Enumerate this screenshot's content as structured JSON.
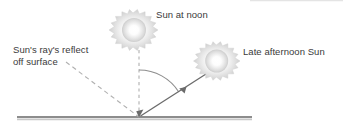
{
  "diagram": {
    "background_color": "#ffffff",
    "labels": {
      "sun_at_noon": "Sun at noon",
      "late_afternoon_sun": "Late afternoon Sun",
      "reflect_line1": "Sun's ray's reflect",
      "reflect_line2": "off surface"
    },
    "text_color": "#3a3a3a",
    "suns": [
      {
        "name": "sun-at-noon",
        "cx": 139,
        "cy": 30,
        "outer_radius": 19,
        "inner_radius": 14,
        "points": 16,
        "core_color": "#ffffff",
        "edge_color": "#c9c9c9"
      },
      {
        "name": "late-afternoon-sun",
        "cx": 222,
        "cy": 61,
        "outer_radius": 18,
        "inner_radius": 13,
        "points": 16,
        "core_color": "#ffffff",
        "edge_color": "#c9c9c9"
      }
    ],
    "ground": {
      "name": "ground-surface",
      "x1": 17,
      "x2": 252,
      "y": 117,
      "color": "#8d8d8d",
      "shadow_color": "#c8c8c8",
      "thickness": 2
    },
    "vertex": {
      "x": 139,
      "y": 117
    },
    "normal_line": {
      "name": "normal-dashed-line",
      "x1": 139,
      "y1": 50,
      "x2": 139,
      "y2": 117,
      "style": "dashed",
      "color": "#b0b0b0"
    },
    "incident_ray": {
      "name": "incident-ray",
      "x1": 206,
      "y1": 74,
      "x2": 139,
      "y2": 117,
      "style": "solid",
      "color": "#6b6b6b",
      "arrow_at": 0.55,
      "arrow_direction": "down-left"
    },
    "reflected_ray": {
      "name": "reflected-ray",
      "x1": 66,
      "y1": 62,
      "x2": 139,
      "y2": 117,
      "style": "dashed",
      "color": "#b0b0b0"
    },
    "angle_arc": {
      "name": "angle-of-incidence-arc",
      "center_x": 139,
      "center_y": 117,
      "radius": 47,
      "start_angle_deg": 90,
      "end_angle_deg": 32,
      "color": "#8d8d8d"
    }
  }
}
